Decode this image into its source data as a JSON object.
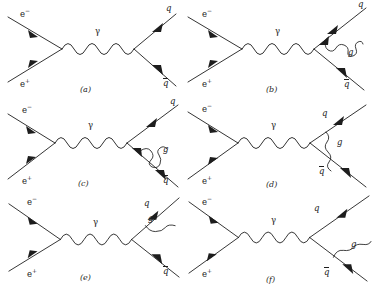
{
  "figure": {
    "background_color": "#ffffff",
    "line_color": "#1d1d1d",
    "rows": 3,
    "cols": 2
  },
  "labels": {
    "electron": "e",
    "electron_charge": "−",
    "positron": "e",
    "positron_charge": "+",
    "photon": "γ",
    "quark": "q",
    "antiquark": "q",
    "gluon": "g"
  },
  "panels": [
    {
      "id": "a",
      "tag": "(a)",
      "description": "Lowest order e+e- -> gamma -> q qbar",
      "particles": [
        "e−",
        "e+",
        "γ",
        "q",
        "q̄"
      ],
      "has_gluon": false
    },
    {
      "id": "b",
      "tag": "(b)",
      "description": "Gluon self-energy loop on outgoing quark line",
      "particles": [
        "e−",
        "e+",
        "γ",
        "q",
        "q̄",
        "g"
      ],
      "has_gluon": true,
      "gluon_label": "g"
    },
    {
      "id": "c",
      "tag": "(c)",
      "description": "Gluon self-energy loop on outgoing antiquark line",
      "particles": [
        "e−",
        "e+",
        "γ",
        "q",
        "q̄",
        "g"
      ],
      "has_gluon": true,
      "gluon_label": "g"
    },
    {
      "id": "d",
      "tag": "(d)",
      "description": "Gluon exchange between quark and antiquark (vertex correction)",
      "particles": [
        "e−",
        "e+",
        "γ",
        "q",
        "q̄",
        "g"
      ],
      "has_gluon": true,
      "gluon_label": "g"
    },
    {
      "id": "e",
      "tag": "(e)",
      "description": "Gluon bremsstrahlung from the outgoing quark",
      "particles": [
        "e−",
        "e+",
        "γ",
        "q",
        "q̄",
        "g"
      ],
      "has_gluon": true,
      "gluon_label": "g"
    },
    {
      "id": "f",
      "tag": "(f)",
      "description": "Gluon bremsstrahlung from the outgoing antiquark",
      "particles": [
        "e−",
        "e+",
        "γ",
        "q",
        "q̄",
        "g"
      ],
      "has_gluon": true,
      "gluon_label": "g"
    }
  ]
}
